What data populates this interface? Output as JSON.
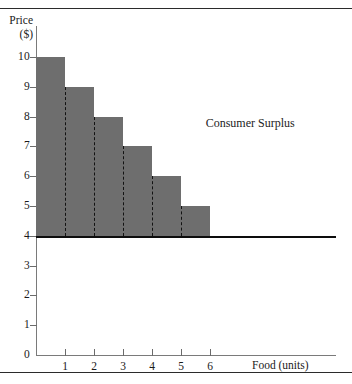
{
  "chart_data": {
    "type": "bar",
    "title": "",
    "xlabel": "Food (units)",
    "ylabel_line1": "Price",
    "ylabel_line2": "($)",
    "categories": [
      "1",
      "2",
      "3",
      "4",
      "5",
      "6"
    ],
    "values": [
      10,
      9,
      8,
      7,
      6,
      5
    ],
    "series": [
      {
        "name": "Willingness to pay (demand steps)",
        "values": [
          10,
          9,
          8,
          7,
          6,
          5
        ]
      }
    ],
    "xlim": [
      0,
      10.35
    ],
    "ylim": [
      0,
      10.7
    ],
    "xticks": [
      1,
      2,
      3,
      4,
      5,
      6
    ],
    "yticks": [
      0,
      1,
      2,
      3,
      4,
      5,
      6,
      7,
      8,
      9,
      10
    ],
    "xtick_labels": [
      "1",
      "2",
      "3",
      "4",
      "5",
      "6"
    ],
    "ytick_labels": [
      "0",
      "1",
      "2",
      "3",
      "4",
      "5",
      "6",
      "7",
      "8",
      "9",
      "10"
    ],
    "grid": false,
    "legend": null,
    "bar_fill_color": "#6e6e6e",
    "price_line": {
      "label": "",
      "value": 4,
      "color": "#0d0d0d",
      "extends_to_x": 10.35
    },
    "unit_dividers": [
      1,
      2,
      3,
      4,
      5
    ],
    "annotations": [
      {
        "text": "Consumer Surplus",
        "x": 5.85,
        "y": 7.8
      }
    ]
  },
  "figure": {
    "top_rule": true,
    "bottom_rule": true,
    "background_color": "#ffffff"
  }
}
